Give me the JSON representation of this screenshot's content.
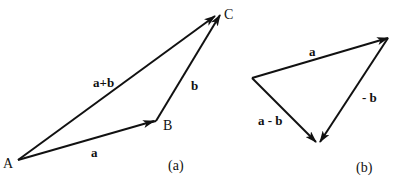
{
  "diagram_a": {
    "caption": "(a)",
    "points": {
      "A": {
        "label": "A",
        "x": 18,
        "y": 160
      },
      "B": {
        "label": "B",
        "x": 155,
        "y": 121
      },
      "C": {
        "label": "C",
        "x": 220,
        "y": 14
      }
    },
    "vectors": [
      {
        "name": "a",
        "label": "a",
        "from": "A",
        "to": "B"
      },
      {
        "name": "b",
        "label": "b",
        "from": "B",
        "to": "C"
      },
      {
        "name": "a+b",
        "label": "a+b",
        "from": "A",
        "to": "C"
      }
    ]
  },
  "diagram_b": {
    "caption": "(b)",
    "vectors": [
      {
        "name": "a",
        "label": "a"
      },
      {
        "name": "-b",
        "label": "- b"
      },
      {
        "name": "a-b",
        "label": "a - b"
      }
    ]
  },
  "colors": {
    "stroke": "#111111",
    "background": "#ffffff"
  }
}
